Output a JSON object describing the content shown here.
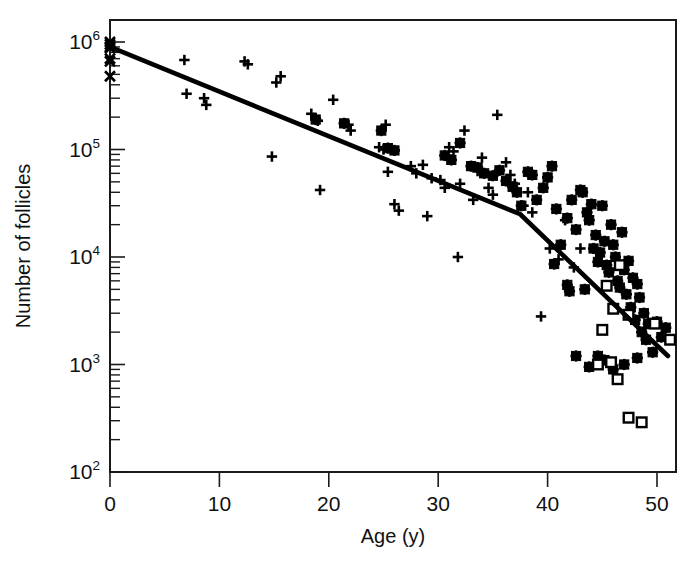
{
  "figure": {
    "background": "#ffffff",
    "ink_color": "#000000"
  },
  "axes": {
    "x_title": "Age (y)",
    "y_title": "Number of follicles",
    "x_ticks": [
      "0",
      "10",
      "20",
      "30",
      "40",
      "50"
    ],
    "y_ticks": [
      "10",
      "10",
      "10",
      "10",
      "10"
    ],
    "y_tick_exponents": [
      "6",
      "5",
      "4",
      "3",
      "2"
    ]
  },
  "chart_data": {
    "type": "scatter",
    "title": "",
    "subtitle": "",
    "xlabel": "Age (y)",
    "ylabel": "Number of follicles",
    "xlim": [
      0,
      52
    ],
    "ylim": [
      100,
      1000000
    ],
    "yscale": "log",
    "xscale": "linear",
    "grid": false,
    "legend": "none",
    "x_tick_values": [
      0,
      10,
      20,
      30,
      40,
      50
    ],
    "y_tick_values": [
      1000000,
      100000,
      10000,
      1000,
      100
    ],
    "y_tick_labels": [
      "10^6",
      "10^5",
      "10^4",
      "10^3",
      "10^2"
    ],
    "y_minor_ticks": true,
    "annotations": [],
    "series": [
      {
        "name": "cross-markers-newborn",
        "marker": "x",
        "filled": true,
        "points": [
          [
            0.0,
            1000000
          ],
          [
            0.0,
            950000
          ],
          [
            0.0,
            900000
          ],
          [
            0.0,
            880000
          ],
          [
            0.0,
            700000
          ],
          [
            0.0,
            660000
          ],
          [
            0.0,
            480000
          ]
        ]
      },
      {
        "name": "plus-markers",
        "marker": "plus",
        "filled": true,
        "points": [
          [
            6.8,
            680000
          ],
          [
            7.0,
            330000
          ],
          [
            8.6,
            300000
          ],
          [
            8.8,
            260000
          ],
          [
            12.3,
            660000
          ],
          [
            12.6,
            620000
          ],
          [
            14.8,
            86000
          ],
          [
            15.2,
            420000
          ],
          [
            15.6,
            480000
          ],
          [
            18.4,
            215000
          ],
          [
            18.8,
            195000
          ],
          [
            19.0,
            185000
          ],
          [
            19.2,
            42000
          ],
          [
            20.4,
            290000
          ],
          [
            21.8,
            170000
          ],
          [
            22.0,
            150000
          ],
          [
            24.6,
            105000
          ],
          [
            25.0,
            100000
          ],
          [
            25.2,
            170000
          ],
          [
            25.4,
            62000
          ],
          [
            26.0,
            31000
          ],
          [
            26.4,
            27000
          ],
          [
            27.5,
            70000
          ],
          [
            28.0,
            60000
          ],
          [
            28.6,
            72000
          ],
          [
            29.0,
            24000
          ],
          [
            29.4,
            54000
          ],
          [
            30.2,
            52000
          ],
          [
            30.6,
            44000
          ],
          [
            31.0,
            105000
          ],
          [
            31.4,
            96000
          ],
          [
            31.8,
            10000
          ],
          [
            32.0,
            48000
          ],
          [
            32.4,
            150000
          ],
          [
            33.2,
            34000
          ],
          [
            33.6,
            63000
          ],
          [
            34.0,
            84000
          ],
          [
            34.6,
            44000
          ],
          [
            35.0,
            38000
          ],
          [
            35.4,
            210000
          ],
          [
            36.2,
            76000
          ],
          [
            36.6,
            58000
          ],
          [
            37.0,
            48000
          ],
          [
            37.8,
            30000
          ],
          [
            38.2,
            40000
          ],
          [
            38.6,
            26000
          ],
          [
            39.4,
            2800
          ],
          [
            40.2,
            12000
          ],
          [
            41.0,
            9500
          ],
          [
            41.6,
            22000
          ],
          [
            42.4,
            8000
          ],
          [
            43.0,
            12000
          ]
        ]
      },
      {
        "name": "filled-square-markers",
        "marker": "square",
        "filled": true,
        "points": [
          [
            18.8,
            190000
          ],
          [
            21.4,
            175000
          ],
          [
            24.8,
            150000
          ],
          [
            25.4,
            103000
          ],
          [
            26.0,
            98000
          ],
          [
            30.6,
            88000
          ],
          [
            31.2,
            80000
          ],
          [
            32.0,
            115000
          ],
          [
            33.0,
            70000
          ],
          [
            33.6,
            68000
          ],
          [
            34.2,
            60000
          ],
          [
            35.0,
            57000
          ],
          [
            35.6,
            64000
          ],
          [
            36.2,
            51000
          ],
          [
            36.8,
            45000
          ],
          [
            37.2,
            40000
          ],
          [
            37.6,
            30000
          ],
          [
            38.2,
            62000
          ],
          [
            38.6,
            58000
          ],
          [
            39.0,
            34000
          ],
          [
            39.6,
            44000
          ],
          [
            40.0,
            55000
          ],
          [
            40.4,
            70000
          ],
          [
            40.8,
            28000
          ],
          [
            41.2,
            13000
          ],
          [
            41.8,
            23000
          ],
          [
            42.2,
            34000
          ],
          [
            42.6,
            18000
          ],
          [
            43.0,
            42000
          ],
          [
            43.2,
            40000
          ],
          [
            43.6,
            26000
          ],
          [
            43.8,
            22000
          ],
          [
            44.0,
            31000
          ],
          [
            44.2,
            12000
          ],
          [
            44.4,
            16000
          ],
          [
            44.6,
            9000
          ],
          [
            44.8,
            11000
          ],
          [
            45.0,
            30000
          ],
          [
            45.2,
            14000
          ],
          [
            45.4,
            8400
          ],
          [
            45.6,
            7200
          ],
          [
            45.8,
            20000
          ],
          [
            46.0,
            13000
          ],
          [
            46.2,
            10000
          ],
          [
            46.4,
            6000
          ],
          [
            46.6,
            5200
          ],
          [
            46.8,
            17000
          ],
          [
            47.0,
            7600
          ],
          [
            47.2,
            4500
          ],
          [
            47.4,
            9200
          ],
          [
            47.6,
            3400
          ],
          [
            47.8,
            6400
          ],
          [
            48.0,
            2600
          ],
          [
            48.2,
            5600
          ],
          [
            48.4,
            4200
          ],
          [
            48.6,
            2000
          ],
          [
            48.8,
            3000
          ],
          [
            49.0,
            1700
          ],
          [
            49.2,
            2400
          ],
          [
            49.6,
            1300
          ],
          [
            50.0,
            2500
          ],
          [
            50.4,
            1800
          ],
          [
            50.8,
            2200
          ],
          [
            43.4,
            5000
          ],
          [
            44.6,
            1200
          ],
          [
            45.2,
            1100
          ],
          [
            46.0,
            900
          ],
          [
            47.0,
            1000
          ],
          [
            42.6,
            1200
          ],
          [
            43.8,
            950
          ],
          [
            48.2,
            1150
          ],
          [
            41.8,
            5500
          ],
          [
            42.0,
            4800
          ],
          [
            40.6,
            8600
          ]
        ]
      },
      {
        "name": "open-square-markers",
        "marker": "square-open",
        "filled": false,
        "points": [
          [
            46.6,
            8400
          ],
          [
            45.4,
            5400
          ],
          [
            46.0,
            3300
          ],
          [
            45.0,
            2100
          ],
          [
            47.4,
            2900
          ],
          [
            44.6,
            1000
          ],
          [
            46.4,
            730
          ],
          [
            47.4,
            320
          ],
          [
            48.6,
            290
          ],
          [
            49.8,
            2400
          ],
          [
            51.2,
            1700
          ],
          [
            45.8,
            1050
          ]
        ]
      }
    ],
    "fit_line": {
      "name": "bilinear-regression",
      "type": "piecewise-linear",
      "style": "solid",
      "width_px": 4.6,
      "vertices": [
        [
          0.0,
          900000
        ],
        [
          37.5,
          25000
        ],
        [
          51.0,
          1200
        ]
      ]
    }
  }
}
